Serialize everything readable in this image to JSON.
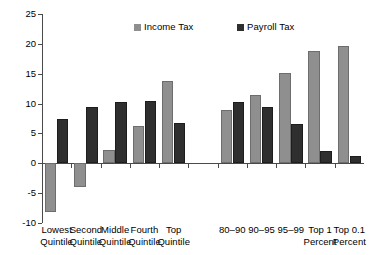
{
  "chart_data": {
    "type": "bar",
    "title": "",
    "subtitle": "",
    "xlabel": "",
    "ylabel": "",
    "ylim": [
      -10,
      25
    ],
    "ytick_values": [
      25,
      20,
      15,
      10,
      5,
      0,
      -5,
      -10
    ],
    "ytick_labels": [
      "25",
      "20",
      "15",
      "10",
      "5",
      "0",
      "-5",
      "-10"
    ],
    "grid": false,
    "legend_position": "top-center",
    "categories": [
      "Lowest Quintile",
      "Second Quintile",
      "Middle Quintile",
      "Fourth Quintile",
      "Top Quintile",
      "",
      "80-90",
      "90-95",
      "95-99",
      "Top 1 Percent",
      "Top 0.1 Percent"
    ],
    "category_label_lines": [
      [
        "Lowest",
        "Quintile"
      ],
      [
        "Second",
        "Quintile"
      ],
      [
        "Middle",
        "Quintile"
      ],
      [
        "Fourth",
        "Quintile"
      ],
      [
        "Top",
        "Quintile"
      ],
      [
        "",
        ""
      ],
      [
        "80–90",
        ""
      ],
      [
        "90–95",
        ""
      ],
      [
        "95–99",
        ""
      ],
      [
        "Top 1",
        "Percent"
      ],
      [
        "Top 0.1",
        "Percent"
      ]
    ],
    "series": [
      {
        "name": "Income Tax",
        "color": "#8f8f8f",
        "values": [
          -8.1,
          -4.0,
          2.3,
          6.3,
          13.8,
          null,
          8.9,
          11.4,
          15.1,
          18.8,
          19.7
        ]
      },
      {
        "name": "Payroll Tax",
        "color": "#2f2f2f",
        "values": [
          7.4,
          9.4,
          10.2,
          10.4,
          6.8,
          null,
          10.3,
          9.5,
          6.5,
          2.1,
          1.2
        ]
      }
    ]
  },
  "legend": {
    "items": [
      {
        "label": "Income Tax",
        "color": "#8f8f8f"
      },
      {
        "label": "Payroll Tax",
        "color": "#2f2f2f"
      }
    ]
  },
  "axis_colors": {
    "axis_line": "#4a4a4a",
    "background": "#ffffff"
  }
}
